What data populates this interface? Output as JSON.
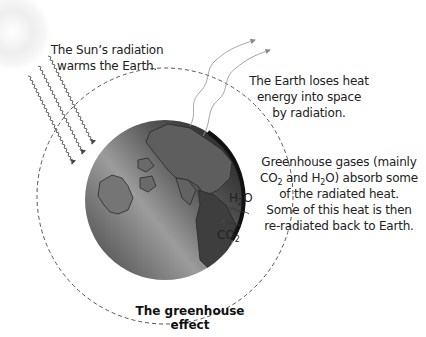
{
  "diagram": {
    "title": "The greenhouse effect",
    "labels": {
      "sun_radiation": [
        "The Sun’s radiation",
        "warms the Earth."
      ],
      "earth_loss": [
        "The Earth loses heat",
        "energy into space",
        "by radiation."
      ],
      "greenhouse": {
        "line1": "Greenhouse gases (mainly",
        "line2_a": "CO",
        "line2_sub1": "2",
        "line2_b": " and H",
        "line2_sub2": "2",
        "line2_c": "O) absorb some",
        "line3": "of the radiated heat.",
        "line4": "Some of this heat is then",
        "line5": "re-radiated back to Earth."
      },
      "h2o": {
        "base": "H",
        "sub": "2",
        "tail": "O"
      },
      "co2": {
        "base": "CO",
        "sub": "2"
      }
    },
    "elements": {
      "sun": "sun-glow",
      "incoming_rays": 3,
      "outgoing_rays": 2,
      "atmosphere": "dashed-circle",
      "earth": "globe"
    },
    "colors": {
      "earth_dark": "#2b2b2b",
      "earth_light": "#9a9a9a",
      "ray": "#666666",
      "dash": "#555555",
      "outgoing_ray": "#999999"
    }
  }
}
